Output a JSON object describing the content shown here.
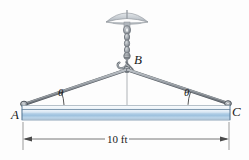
{
  "figure": {
    "type": "engineering-statics-free-body-diagram",
    "background_color": "#fdfdfd"
  },
  "labels": {
    "point_a": "A",
    "point_b": "B",
    "point_c": "C",
    "theta_left": "θ",
    "theta_right": "θ",
    "dimension": "10 ft"
  },
  "colors": {
    "beam_top_highlight": "#f2f6fb",
    "beam_light": "#dce9f5",
    "beam_mid": "#a8c6e2",
    "beam_dark": "#7ba7cd",
    "beam_outline": "#5f7f9c",
    "sling": "#8a8f96",
    "sling_outline": "#4a4f56",
    "chain": "#9aa0a6",
    "canopy": "#c9ced3",
    "dimension_line": "#4a4a4a",
    "centerline": "#8d9399",
    "label_text": "#1a1a1a"
  },
  "geometry": {
    "point_a": {
      "x": 23,
      "y": 104
    },
    "point_b": {
      "x": 127,
      "y": 69
    },
    "point_c": {
      "x": 228,
      "y": 103
    },
    "beam_left_x": 22,
    "beam_right_x": 230,
    "beam_top_y": 105,
    "beam_bottom_y": 120,
    "dimension_y": 139,
    "canopy_center_x": 127,
    "canopy_y": 12
  },
  "icons": {
    "ceiling_mount": "canopy-icon",
    "chain": "chain-icon",
    "hook": "hook-icon",
    "angle_arc": "angle-arc-icon",
    "arrow_left": "arrow-left-icon",
    "arrow_right": "arrow-right-icon"
  }
}
